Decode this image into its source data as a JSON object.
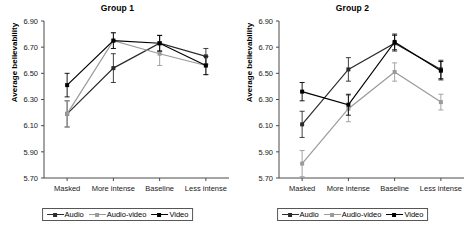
{
  "figure": {
    "ylabel": "Average believability",
    "legend": {
      "entries": [
        {
          "label": "Audio",
          "color": "#2b2b2b"
        },
        {
          "label": "Audio-video",
          "color": "#9a9a9a"
        },
        {
          "label": "Video",
          "color": "#000000"
        }
      ]
    }
  },
  "chart_data": [
    {
      "type": "line",
      "title": "Group 1",
      "xlabel": "",
      "ylabel": "Average believability",
      "categories": [
        "Masked",
        "More intense",
        "Baseline",
        "Less intense"
      ],
      "yticks": [
        "5.70",
        "5.90",
        "6.10",
        "6.30",
        "6.50",
        "6.70",
        "6.90"
      ],
      "ylim": [
        5.7,
        6.9
      ],
      "grid": false,
      "legend_position": "bottom",
      "series": [
        {
          "name": "Audio",
          "color": "#2b2b2b",
          "values": [
            6.19,
            6.54,
            6.73,
            6.63
          ],
          "errors": [
            0.1,
            0.11,
            0.06,
            0.06
          ]
        },
        {
          "name": "Audio-video",
          "color": "#9a9a9a",
          "values": [
            6.19,
            6.75,
            6.65,
            6.56
          ],
          "errors": [
            0.1,
            0.06,
            0.09,
            0.07
          ]
        },
        {
          "name": "Video",
          "color": "#000000",
          "values": [
            6.41,
            6.75,
            6.73,
            6.56
          ],
          "errors": [
            0.09,
            0.06,
            0.06,
            0.07
          ]
        }
      ]
    },
    {
      "type": "line",
      "title": "Group 2",
      "xlabel": "",
      "ylabel": "Average believability",
      "categories": [
        "Masked",
        "More intense",
        "Baseline",
        "Less intense"
      ],
      "yticks": [
        "5.70",
        "5.90",
        "6.10",
        "6.30",
        "6.50",
        "6.70",
        "6.90"
      ],
      "ylim": [
        5.7,
        6.9
      ],
      "grid": false,
      "legend_position": "bottom",
      "series": [
        {
          "name": "Audio",
          "color": "#2b2b2b",
          "values": [
            6.11,
            6.53,
            6.73,
            6.53
          ],
          "errors": [
            0.1,
            0.09,
            0.06,
            0.07
          ]
        },
        {
          "name": "Audio-video",
          "color": "#9a9a9a",
          "values": [
            5.81,
            6.23,
            6.51,
            6.28
          ],
          "errors": [
            0.1,
            0.1,
            0.07,
            0.06
          ]
        },
        {
          "name": "Video",
          "color": "#000000",
          "values": [
            6.36,
            6.26,
            6.74,
            6.52
          ],
          "errors": [
            0.07,
            0.08,
            0.06,
            0.07
          ]
        }
      ]
    }
  ]
}
